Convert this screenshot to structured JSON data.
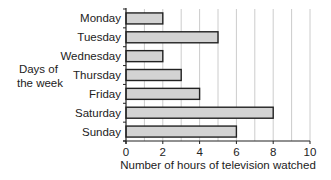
{
  "chart_data": {
    "type": "bar",
    "orientation": "horizontal",
    "title": "",
    "xlabel": "Number of hours of television watched",
    "ylabel": "Days of the week",
    "ylabel_lines": [
      "Days of",
      "the week"
    ],
    "categories": [
      "Monday",
      "Tuesday",
      "Wednesday",
      "Thursday",
      "Friday",
      "Saturday",
      "Sunday"
    ],
    "values": [
      2,
      5,
      2,
      3,
      4,
      8,
      6
    ],
    "xlim": [
      0,
      10
    ],
    "xticks": [
      0,
      2,
      4,
      6,
      8,
      10
    ],
    "grid": "vertical at every 1 unit",
    "legend": null,
    "bar_fill": "#d3d3d3",
    "bar_stroke": "#222222",
    "grid_color": "#cccccc"
  }
}
